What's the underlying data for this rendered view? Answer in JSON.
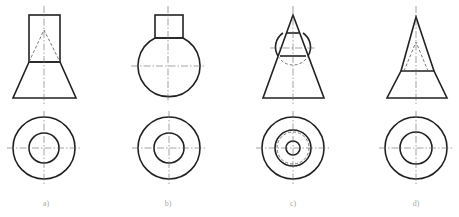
{
  "figure": {
    "panels": [
      {
        "id": "a",
        "label": "a)",
        "description": "Cylinder on truncated cone with hidden conical hole; top view two concentric circles"
      },
      {
        "id": "b",
        "label": "b)",
        "description": "Cylinder on sphere; top view two concentric circles"
      },
      {
        "id": "c",
        "label": "c)",
        "description": "Cone intersected by sphere; top view three concentric circles with hidden circle"
      },
      {
        "id": "d",
        "label": "d)",
        "description": "Cone on truncated cone with hidden conical hole; top view two concentric circles"
      }
    ],
    "colors": {
      "line": "#222222",
      "label": "#aaaaaa",
      "background": "#ffffff"
    }
  }
}
